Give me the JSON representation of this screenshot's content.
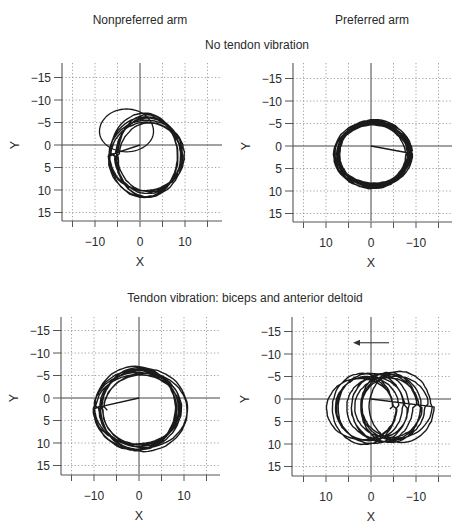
{
  "figure": {
    "column_titles": [
      "Nonpreferred arm",
      "Preferred arm"
    ],
    "row_titles": [
      "No tendon vibration",
      "Tendon vibration: biceps and anterior deltoid"
    ]
  },
  "colors": {
    "trace": "#1a1a1a",
    "axis": "#555555",
    "grid": "#8a8a8a",
    "zero_line": "#444444",
    "text": "#2a2a2a"
  },
  "chart_data": [
    {
      "type": "line",
      "panel": "top-left",
      "column": "Nonpreferred arm",
      "row": "No tendon vibration",
      "xlabel": "X",
      "ylabel": "Y",
      "x_ticks": [
        -10,
        0,
        10
      ],
      "y_ticks": [
        -15,
        -10,
        -5,
        0,
        5,
        10,
        15
      ],
      "xlim": [
        -17,
        17
      ],
      "ylim": [
        -19,
        17
      ],
      "x_reversed": false,
      "y_reversed": true,
      "grid": true,
      "trajectory": {
        "center_x": 1.5,
        "center_y": 2.5,
        "radius_x": 7.5,
        "radius_y": 8.5,
        "loops": 8,
        "drift_x": 1.5,
        "drift_y": 0.5,
        "jitter": 0.9,
        "start": [
          0,
          0
        ],
        "stray_loop": {
          "cx": -3,
          "cy": -3,
          "rx": 6,
          "ry": 5
        }
      }
    },
    {
      "type": "line",
      "panel": "top-right",
      "column": "Preferred arm",
      "row": "No tendon vibration",
      "xlabel": "X",
      "ylabel": "Y",
      "x_ticks": [
        10,
        0,
        -10
      ],
      "y_ticks": [
        -15,
        -10,
        -5,
        0,
        5,
        10,
        15
      ],
      "xlim": [
        17,
        -17
      ],
      "ylim": [
        -19,
        17
      ],
      "x_reversed": true,
      "y_reversed": true,
      "grid": true,
      "trajectory": {
        "center_x": -0.5,
        "center_y": 1.8,
        "radius_x": 8.0,
        "radius_y": 7.0,
        "loops": 12,
        "drift_x": 0.6,
        "drift_y": 0.4,
        "jitter": 0.5,
        "start": [
          0,
          0
        ]
      }
    },
    {
      "type": "line",
      "panel": "bottom-left",
      "column": "Nonpreferred arm",
      "row": "Tendon vibration: biceps and anterior deltoid",
      "xlabel": "X",
      "ylabel": "Y",
      "x_ticks": [
        -10,
        0,
        10
      ],
      "y_ticks": [
        -15,
        -10,
        -5,
        0,
        5,
        10,
        15
      ],
      "xlim": [
        -17,
        17
      ],
      "ylim": [
        -19,
        17
      ],
      "x_reversed": false,
      "y_reversed": true,
      "grid": true,
      "trajectory": {
        "center_x": 0.0,
        "center_y": 2.5,
        "radius_x": 9.0,
        "radius_y": 8.5,
        "loops": 10,
        "drift_x": 2.0,
        "drift_y": 0.5,
        "jitter": 0.8,
        "start": [
          0,
          0
        ]
      }
    },
    {
      "type": "line",
      "panel": "bottom-right",
      "column": "Preferred arm",
      "row": "Tendon vibration: biceps and anterior deltoid",
      "xlabel": "X",
      "ylabel": "Y",
      "x_ticks": [
        10,
        0,
        -10
      ],
      "y_ticks": [
        -15,
        -10,
        -5,
        0,
        5,
        10,
        15
      ],
      "xlim": [
        17,
        -17
      ],
      "ylim": [
        -19,
        17
      ],
      "x_reversed": true,
      "y_reversed": true,
      "grid": true,
      "annotation": {
        "type": "arrow",
        "direction": "toward +X (left on reversed axis)",
        "from": [
          -4,
          -12.5
        ],
        "to": [
          4,
          -12.5
        ]
      },
      "trajectory": {
        "center_x": -2.0,
        "center_y": 2.0,
        "radius_x": 7.0,
        "radius_y": 7.3,
        "loops": 13,
        "drift_x": 10.0,
        "drift_y": 0.5,
        "jitter": 0.6,
        "start": [
          0,
          0
        ]
      }
    }
  ]
}
